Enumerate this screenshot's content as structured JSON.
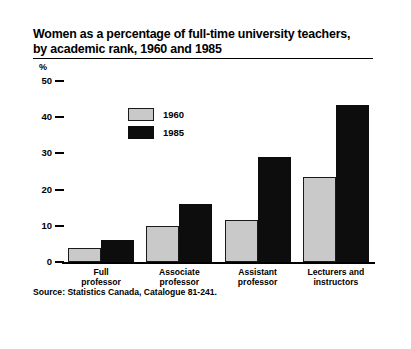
{
  "chart_data": {
    "type": "bar",
    "title": "Women as a percentage of full-time university teachers, by academic rank, 1960 and 1985",
    "title_line1": "Women as a percentage of full-time university teachers,",
    "title_line2": "by academic rank, 1960 and 1985",
    "xlabel": "",
    "ylabel": "%",
    "ylim": [
      0,
      50
    ],
    "yticks": [
      0,
      10,
      20,
      30,
      40,
      50
    ],
    "ytick_labels": [
      "0",
      "10",
      "20",
      "30",
      "40",
      "50"
    ],
    "grid": false,
    "legend_position": "inside-upper-left",
    "categories": [
      "Full professor",
      "Associate professor",
      "Assistant professor",
      "Lecturers and instructors"
    ],
    "category_lines": [
      [
        "Full",
        "professor"
      ],
      [
        "Associate",
        "professor"
      ],
      [
        "Assistant",
        "professor"
      ],
      [
        "Lecturers and",
        "instructors"
      ]
    ],
    "series": [
      {
        "name": "1960",
        "color": "#c9c9c9",
        "values": [
          3.9,
          10.0,
          11.5,
          23.5
        ]
      },
      {
        "name": "1985",
        "color": "#0d0d0d",
        "values": [
          6.0,
          16.0,
          29.0,
          43.5
        ]
      }
    ],
    "source": "Source: Statistics Canada, Catalogue 81-241."
  },
  "colors": {
    "series_1960": "#c9c9c9",
    "series_1985": "#0d0d0d",
    "border_pattern": "#8f8f8f",
    "axis": "#000000",
    "background": "#ffffff"
  }
}
